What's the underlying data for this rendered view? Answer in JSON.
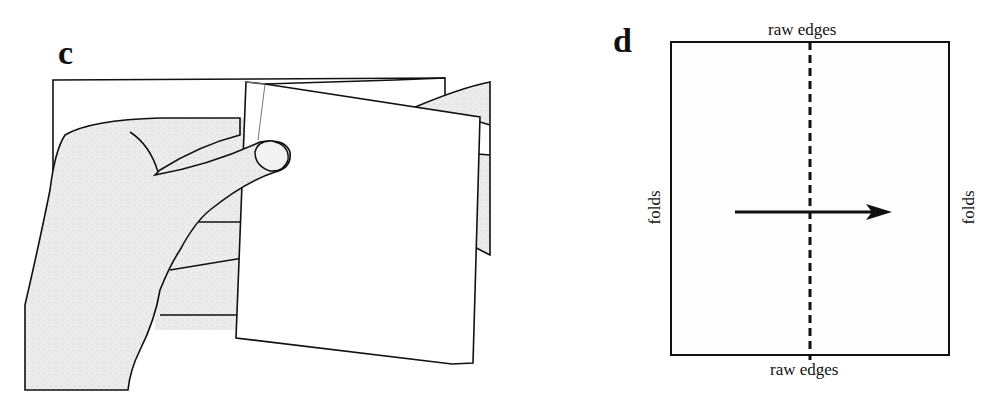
{
  "panels": [
    {
      "id": "c",
      "label": "c",
      "description": "Hands holding a folded piece of paper"
    },
    {
      "id": "d",
      "label": "d",
      "description": "Rectangle diagram with dashed center line and arrow",
      "labels": {
        "top": "raw edges",
        "bottom": "raw edges",
        "left": "folds",
        "right": "folds"
      }
    }
  ],
  "colors": {
    "line": "#111111",
    "shade": "#e4e4e4",
    "paper": "#ffffff"
  }
}
